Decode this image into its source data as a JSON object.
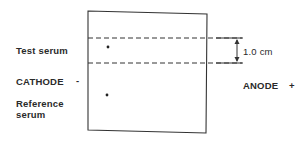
{
  "labels": {
    "test_serum": "Test serum",
    "cathode": "CATHODE",
    "cathode_sign": "-",
    "reference_line1": "Reference",
    "reference_line2": "serum",
    "anode": "ANODE",
    "anode_sign": "+",
    "distance": "1.0 cm"
  },
  "colors": {
    "line": "#333333",
    "text": "#2a2a2a"
  }
}
